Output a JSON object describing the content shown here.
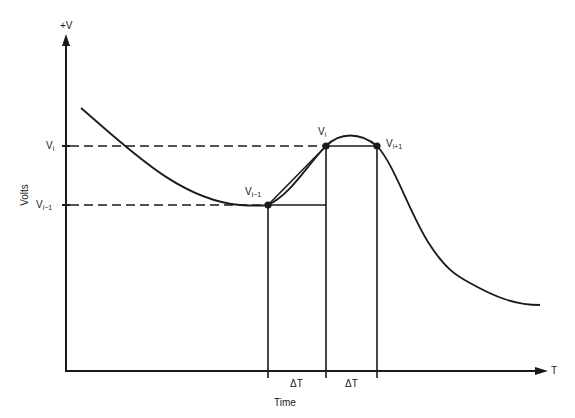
{
  "diagram": {
    "y_axis": {
      "label": "Volts",
      "top_label": "+V"
    },
    "x_axis": {
      "label": "Time",
      "end_label": "T"
    },
    "levels": [
      {
        "name": "V",
        "sub": "i",
        "y": 146
      },
      {
        "name": "V",
        "sub": "i−1",
        "y": 205
      }
    ],
    "points": [
      {
        "name": "V",
        "sub": "i−1"
      },
      {
        "name": "V",
        "sub": "i"
      },
      {
        "name": "V",
        "sub": "i+1"
      }
    ],
    "intervals": [
      {
        "label": "ΔT"
      },
      {
        "label": "ΔT"
      }
    ],
    "colors": {
      "line": "#1a1a1a",
      "background": "#ffffff"
    }
  }
}
